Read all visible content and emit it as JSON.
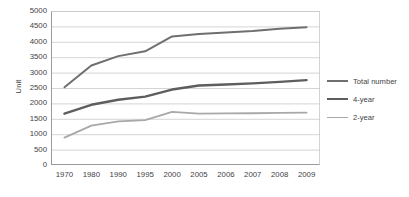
{
  "chart_data": {
    "type": "line",
    "title": "",
    "xlabel": "",
    "ylabel": "Unit",
    "categories": [
      "1970",
      "1980",
      "1990",
      "1995",
      "2000",
      "2005",
      "2006",
      "2007",
      "2008",
      "2009"
    ],
    "ylim": [
      0,
      5000
    ],
    "yticks": [
      5000,
      4500,
      4000,
      3500,
      3000,
      2500,
      2000,
      1500,
      1000,
      500,
      0
    ],
    "grid": "horizontal",
    "legend_position": "right",
    "series": [
      {
        "name": "Total number",
        "color": "#6f6f6f",
        "width": 2.0,
        "values": [
          2525,
          3230,
          3535,
          3690,
          4175,
          4255,
          4300,
          4350,
          4420,
          4475
        ]
      },
      {
        "name": "4-year",
        "color": "#5e5e5e",
        "width": 2.4,
        "values": [
          1665,
          1955,
          2120,
          2220,
          2450,
          2580,
          2615,
          2650,
          2700,
          2755
        ]
      },
      {
        "name": "2-year",
        "color": "#a8a8a8",
        "width": 1.8,
        "values": [
          890,
          1280,
          1415,
          1455,
          1725,
          1665,
          1675,
          1680,
          1690,
          1700
        ]
      }
    ]
  },
  "axis": {
    "y_title": "Unit"
  },
  "legend": {
    "items": [
      {
        "label": "Total number"
      },
      {
        "label": "4-year"
      },
      {
        "label": "2-year"
      }
    ]
  },
  "colors": {
    "gridline": "#c9c9c9",
    "axis": "#9a9a9a",
    "text": "#3f3f3f",
    "background": "#ffffff"
  }
}
